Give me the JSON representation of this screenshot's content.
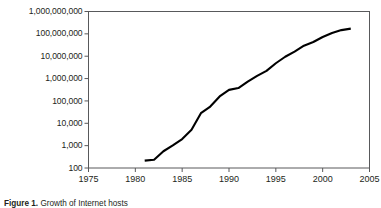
{
  "figure": {
    "caption_bold": "Figure 1.",
    "caption_rest": "Growth of Internet hosts"
  },
  "chart_data": {
    "type": "line",
    "title": "",
    "xlabel": "",
    "ylabel": "",
    "grid": false,
    "legend_position": "none",
    "xlim": [
      1975,
      2005
    ],
    "ylim": [
      100,
      1000000000
    ],
    "yscale": "log",
    "xscale": "linear",
    "xticks": [
      1975,
      1980,
      1985,
      1990,
      1995,
      2000,
      2005
    ],
    "xticklabels": [
      "1975",
      "1980",
      "1985",
      "1990",
      "1995",
      "2000",
      "2005"
    ],
    "yticks": [
      100,
      1000,
      10000,
      100000,
      1000000,
      10000000,
      100000000,
      1000000000
    ],
    "yticklabels": [
      "100",
      "1,000",
      "10,000",
      "100,000",
      "1,000,000",
      "10,000,000",
      "100,000,000",
      "1,000,000,000"
    ],
    "series": [
      {
        "name": "Internet hosts",
        "color": "#000000",
        "x": [
          1981,
          1982,
          1983,
          1984,
          1985,
          1986,
          1987,
          1988,
          1989,
          1990,
          1991,
          1992,
          1993,
          1994,
          1995,
          1996,
          1997,
          1998,
          1999,
          2000,
          2001,
          2002,
          2003
        ],
        "values": [
          213,
          235,
          562,
          1024,
          1961,
          5089,
          28174,
          56000,
          159000,
          313000,
          376000,
          727000,
          1313000,
          2217000,
          4852000,
          9472000,
          16146000,
          29670000,
          43230000,
          72398000,
          109574000,
          147344000,
          171638000
        ]
      }
    ]
  }
}
